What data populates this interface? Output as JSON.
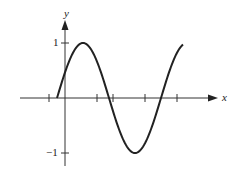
{
  "chart_data": {
    "type": "line",
    "title": "",
    "xlabel": "x",
    "ylabel": "y",
    "ytick_labels": [
      "1",
      "−1"
    ],
    "yticks": [
      1,
      -1
    ],
    "xticks_unlabeled_count": 5,
    "ylim": [
      -1.2,
      1.4
    ],
    "grid": false,
    "series": [
      {
        "name": "sinusoid",
        "description": "sine wave starting at y≈0 just left of y-axis, rising to max 1, falling to min -1, rising back to 1",
        "x": [
          -0.15,
          0.0,
          0.33,
          0.8,
          1.38,
          1.85,
          2.35
        ],
        "y": [
          0.0,
          0.45,
          1.0,
          0.0,
          -1.0,
          0.0,
          1.0
        ]
      }
    ]
  },
  "labels": {
    "x_axis": "x",
    "y_axis": "y",
    "y_one": "1",
    "y_neg_one": "−1"
  }
}
